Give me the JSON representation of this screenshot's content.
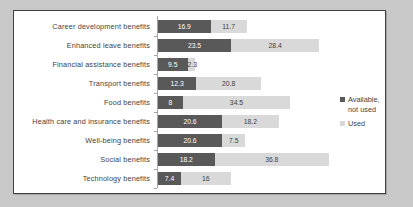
{
  "chart_data": {
    "type": "bar",
    "orientation": "horizontal",
    "stacked": true,
    "title": "",
    "subtitle": "",
    "xlabel": "",
    "ylabel": "",
    "grid": false,
    "legend_position": "right",
    "xlim": [
      0,
      55
    ],
    "categories": [
      "Career development benefits",
      "Enhanced leave benefits",
      "Financial assistance benefits",
      "Transport benefits",
      "Food benefits",
      "Health care and insurance benefits",
      "Well-being benefits",
      "Social benefits",
      "Technology benefits"
    ],
    "series": [
      {
        "name": "Available, not used",
        "color": "#595959",
        "values": [
          16.9,
          23.5,
          9.5,
          12.3,
          8,
          20.6,
          20.6,
          18.2,
          7.4
        ],
        "labels": [
          "16.9",
          "23.5",
          "9.5",
          "12.3",
          "8",
          "20.6",
          "20.6",
          "18.2",
          "7.4"
        ]
      },
      {
        "name": "Used",
        "color": "#d9d9d9",
        "values": [
          11.7,
          28.4,
          2.3,
          20.8,
          34.5,
          18.2,
          7.5,
          36.8,
          16
        ],
        "labels": [
          "11.7",
          "28.4",
          "2.3",
          "20.8",
          "34.5",
          "18.2",
          "7.5",
          "36.8",
          "16"
        ]
      }
    ]
  },
  "legend": {
    "items": [
      {
        "label": "Available, not used",
        "swatch": "dark"
      },
      {
        "label": "Used",
        "swatch": "light"
      }
    ]
  }
}
